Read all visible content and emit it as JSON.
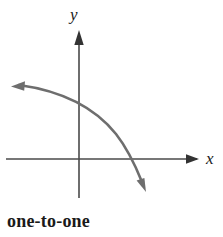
{
  "figure": {
    "caption": "one-to-one",
    "background_color": "#ffffff",
    "axis_color": "#4a4a4a",
    "curve_color": "#6e6e6e",
    "text_color": "#1a1a1a",
    "axes": {
      "x_axis_label": "x",
      "y_axis_label": "y",
      "x_axis": {
        "from_x": 6,
        "to_x": 202,
        "y": 159,
        "arrow": "right"
      },
      "y_axis": {
        "x": 79,
        "from_y": 198,
        "to_y": 30,
        "arrow": "up"
      }
    },
    "curve": {
      "description": "decreasing concave-down curve with arrowheads at both ends",
      "y_intercept_pixel_y": 99,
      "x_intercept_pixel_x": 133,
      "start_point": [
        11,
        87
      ],
      "end_point": [
        146,
        192
      ],
      "arrow_start": "left",
      "arrow_end": "down-right"
    }
  }
}
